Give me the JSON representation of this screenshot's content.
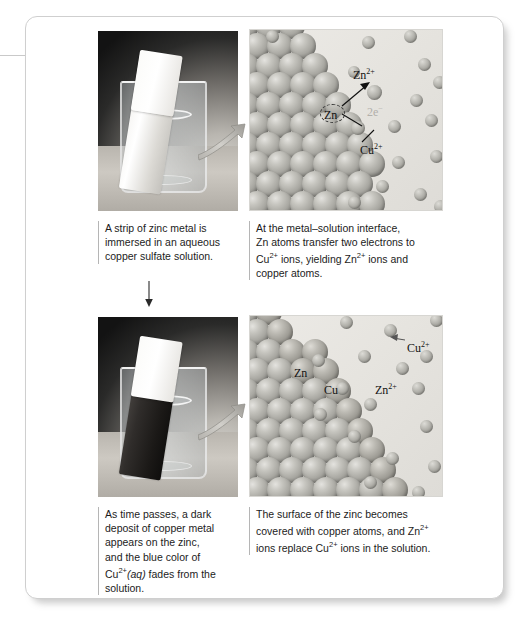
{
  "figure": {
    "title_visible": false,
    "background_color": "#ffffff",
    "frame_border_color": "#cfcfcf"
  },
  "panels": {
    "top_left_photo": {
      "name": "zinc strip in copper sulfate solution photograph",
      "beaker_label": "beaker",
      "strip_state": "bright uncoated zinc metal"
    },
    "top_right_diagram": {
      "name": "atomic view of metal-solution interface",
      "labels": [
        {
          "text": "Zn",
          "superscript": "2+",
          "kind": "ion-label"
        },
        {
          "text": "Zn",
          "superscript": "",
          "kind": "atom-label-circled"
        },
        {
          "text": "2e",
          "superscript": "−",
          "kind": "electron-label",
          "color": "#b2b0ab"
        },
        {
          "text": "Cu",
          "superscript": "2+",
          "kind": "ion-label"
        }
      ]
    },
    "bottom_left_photo": {
      "name": "zinc strip coated with copper deposit photograph",
      "strip_state": "dark copper-coated zinc metal"
    },
    "bottom_right_diagram": {
      "name": "atomic view of copper-covered zinc surface",
      "labels": [
        {
          "text": "Zn",
          "superscript": "",
          "kind": "atom-label"
        },
        {
          "text": "Cu",
          "superscript": "",
          "kind": "atom-label"
        },
        {
          "text": "Zn",
          "superscript": "2+",
          "kind": "ion-label"
        },
        {
          "text": "Cu",
          "superscript": "2+",
          "kind": "ion-label"
        }
      ]
    }
  },
  "captions": {
    "top_left": [
      "A strip of zinc metal is",
      "immersed in an aqueous",
      "copper sulfate solution."
    ],
    "top_right_line1": "At the metal–solution interface,",
    "top_right_line2": "Zn atoms transfer two electrons to",
    "top_right_line3_pre": "Cu",
    "top_right_line3_sup": "2+",
    "top_right_line3_mid": " ions, yielding Zn",
    "top_right_line3_sup2": "2+",
    "top_right_line3_post": " ions and",
    "top_right_line4": "copper atoms.",
    "bottom_left_line1": "As time passes, a dark",
    "bottom_left_line2": "deposit of copper metal",
    "bottom_left_line3": "appears on the zinc,",
    "bottom_left_line4": "and the blue color of",
    "bottom_left_line5_pre": "Cu",
    "bottom_left_line5_sup": "2+",
    "bottom_left_line5_aq": "(aq)",
    "bottom_left_line5_post": " fades from the",
    "bottom_left_line6": "solution.",
    "bottom_right_line1": "The surface of the zinc becomes",
    "bottom_right_line2_pre": "covered with copper atoms, and Zn",
    "bottom_right_line2_sup": "2+",
    "bottom_right_line3_pre": "ions replace Cu",
    "bottom_right_line3_sup": "2+",
    "bottom_right_line3_post": " ions in the solution."
  },
  "arrows": {
    "step_arrow_name": "downward progression arrow",
    "connector_top_name": "magnification arrow from photo to atomic diagram",
    "connector_bottom_name": "magnification arrow from photo to atomic diagram",
    "electron_transfer_arrow_name": "electron transfer arrow"
  },
  "chart_data": {
    "type": "diagram",
    "stages": [
      {
        "stage": 1,
        "photo": "bright zinc strip in blue copper sulfate solution",
        "atomic_view": "zinc lattice at left, Cu2+ ions in solution at right",
        "species_labeled": [
          "Zn",
          "Zn2+",
          "2e-",
          "Cu2+"
        ]
      },
      {
        "stage": 2,
        "photo": "zinc strip covered in dark copper deposit",
        "atomic_view": "copper atom layer on zinc surface, Zn2+ ions in solution",
        "species_labeled": [
          "Zn",
          "Cu",
          "Zn2+",
          "Cu2+"
        ]
      }
    ],
    "net_reaction": "Zn(s) + Cu2+(aq) -> Zn2+(aq) + Cu(s)",
    "electrons_transferred": 2
  }
}
